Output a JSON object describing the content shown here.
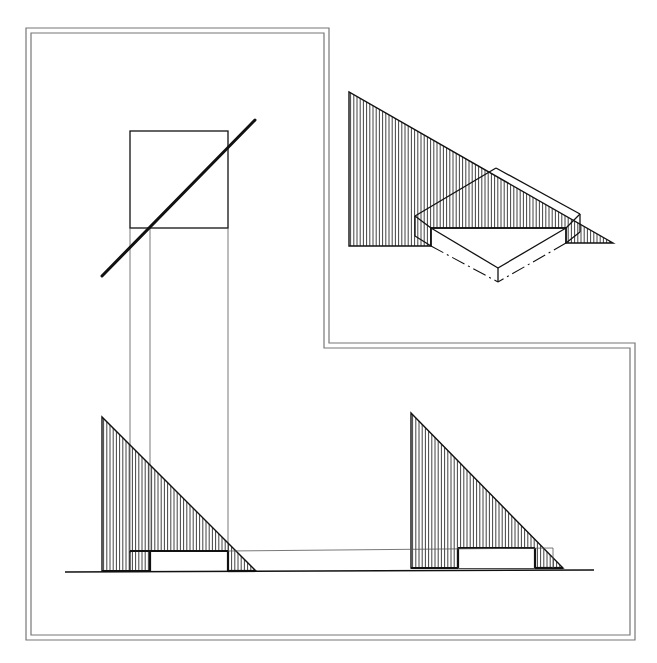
{
  "canvas": {
    "width": 657,
    "height": 663,
    "background": "#ffffff"
  },
  "colors": {
    "ink": "#111111",
    "frame": "#777777",
    "construction": "#555555"
  },
  "frame": {
    "outer": [
      [
        26,
        28
      ],
      [
        329,
        28
      ],
      [
        329,
        343
      ],
      [
        635,
        343
      ],
      [
        635,
        640
      ],
      [
        26,
        640
      ]
    ],
    "inner": [
      [
        31,
        33
      ],
      [
        324,
        33
      ],
      [
        324,
        348
      ],
      [
        630,
        348
      ],
      [
        630,
        635
      ],
      [
        31,
        635
      ]
    ]
  },
  "plan_view": {
    "square": {
      "x": 130,
      "y": 131,
      "w": 98,
      "h": 97
    },
    "diagonal": {
      "x1": 102,
      "y1": 276,
      "x2": 255,
      "y2": 120
    },
    "projectors": [
      {
        "x1": 130,
        "y1": 228,
        "x2": 130,
        "y2": 553
      },
      {
        "x1": 150,
        "y1": 228,
        "x2": 150,
        "y2": 553
      },
      {
        "x1": 228,
        "y1": 228,
        "x2": 228,
        "y2": 553
      }
    ]
  },
  "elevation_left": {
    "triangle": [
      [
        102,
        417
      ],
      [
        102,
        571
      ],
      [
        256,
        571
      ]
    ],
    "block": {
      "x1": 130,
      "x2": 228,
      "y_top": 551,
      "y_base": 571,
      "notch_x": 150
    },
    "hatch_spacing": 3.2
  },
  "elevation_right": {
    "triangle": [
      [
        411,
        413
      ],
      [
        411,
        568
      ],
      [
        563,
        568
      ]
    ],
    "block": {
      "x1": 458,
      "x2": 535,
      "y_top": 548,
      "y_base": 568
    },
    "ghost_box": {
      "x1": 535,
      "x2": 553,
      "y_top": 548,
      "y_base": 568
    },
    "hatch_spacing": 3.2
  },
  "ground_line": {
    "x1": 65,
    "y1": 572,
    "x2": 594,
    "y2": 570
  },
  "link_line": {
    "x1": 228,
    "y1": 551,
    "x2": 553,
    "y2": 548
  },
  "isometric_view": {
    "shadow_polygon": [
      [
        349,
        92
      ],
      [
        349,
        246
      ],
      [
        431,
        246
      ],
      [
        431,
        228
      ],
      [
        566,
        228
      ],
      [
        566,
        243
      ],
      [
        613,
        243
      ]
    ],
    "hatch_spacing": 3.2,
    "block_top": [
      [
        415,
        216
      ],
      [
        496,
        168
      ],
      [
        580,
        214
      ],
      [
        580,
        222
      ],
      [
        566,
        228
      ],
      [
        431,
        228
      ]
    ],
    "block_edges": [
      [
        [
          415,
          216
        ],
        [
          496,
          168
        ]
      ],
      [
        [
          496,
          168
        ],
        [
          580,
          214
        ]
      ],
      [
        [
          415,
          216
        ],
        [
          415,
          236
        ]
      ],
      [
        [
          415,
          216
        ],
        [
          431,
          228
        ]
      ],
      [
        [
          415,
          236
        ],
        [
          431,
          246
        ]
      ],
      [
        [
          431,
          228
        ],
        [
          431,
          246
        ]
      ],
      [
        [
          431,
          228
        ],
        [
          566,
          228
        ]
      ],
      [
        [
          566,
          228
        ],
        [
          580,
          214
        ]
      ],
      [
        [
          580,
          214
        ],
        [
          580,
          232
        ]
      ],
      [
        [
          566,
          228
        ],
        [
          566,
          243
        ]
      ],
      [
        [
          566,
          243
        ],
        [
          580,
          232
        ]
      ],
      [
        [
          431,
          228
        ],
        [
          498,
          268
        ]
      ],
      [
        [
          566,
          228
        ],
        [
          498,
          268
        ]
      ],
      [
        [
          498,
          268
        ],
        [
          498,
          282
        ]
      ]
    ],
    "hidden_edges": [
      [
        [
          431,
          246
        ],
        [
          498,
          282
        ]
      ],
      [
        [
          566,
          243
        ],
        [
          498,
          282
        ]
      ]
    ]
  }
}
